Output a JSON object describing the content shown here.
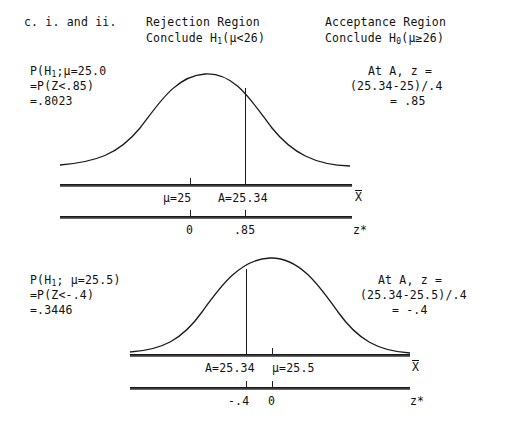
{
  "header": {
    "item_label": "c. i. and ii.",
    "left_title": "Rejection Region",
    "left_subtitle": "Conclude H",
    "left_sub": "1",
    "left_cond": "(μ<26)",
    "right_title": "Acceptance Region",
    "right_subtitle": "Conclude H",
    "right_sub": "0",
    "right_cond": "(μ≥26)"
  },
  "panel1": {
    "left_line1_a": "P(H",
    "left_line1_sub": "1",
    "left_line1_b": ";μ=25.0",
    "left_line2": "=P(Z<.85)",
    "left_line3": "=.8023",
    "right_line1": "At A, z =",
    "right_line2": "(25.34-25)/.4",
    "right_line3": "= .85",
    "xbar_axis": {
      "label": "X",
      "ticks": [
        {
          "label": "μ=25"
        },
        {
          "label": "A=25.34"
        }
      ]
    },
    "z_axis": {
      "label": "z*",
      "ticks": [
        {
          "label": "0"
        },
        {
          "label": ".85"
        }
      ]
    }
  },
  "panel2": {
    "left_line1_a": "P(H",
    "left_line1_sub": "1",
    "left_line1_b": "; μ=25.5)",
    "left_line2": "=P(Z<-.4)",
    "left_line3": "=.3446",
    "right_line1": "At A, z =",
    "right_line2": "(25.34-25.5)/.4",
    "right_line3": "= -.4",
    "xbar_axis": {
      "label": "X",
      "ticks": [
        {
          "label": "A=25.34"
        },
        {
          "label": "μ=25.5"
        }
      ]
    },
    "z_axis": {
      "label": "z*",
      "ticks": [
        {
          "label": "-.4"
        },
        {
          "label": "0"
        }
      ]
    }
  },
  "colors": {
    "ink": "#111111",
    "axis": "#3a3a3a",
    "background": "#ffffff"
  }
}
